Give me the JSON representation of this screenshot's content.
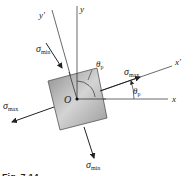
{
  "figure": {
    "caption": "Fig. 7-14",
    "origin_label": "O",
    "axes": {
      "x": "x",
      "y": "y",
      "x_prime": "x'",
      "y_prime": "y'"
    },
    "angles": {
      "theta_p_symbol": "θ",
      "theta_p_sub": "p"
    },
    "stresses": {
      "sigma": "σ",
      "max_sub": "max",
      "min_sub": "min"
    },
    "colors": {
      "element_fill": "#9a9a9a",
      "element_fill_light": "#d8d8d8",
      "line": "#333333"
    }
  }
}
